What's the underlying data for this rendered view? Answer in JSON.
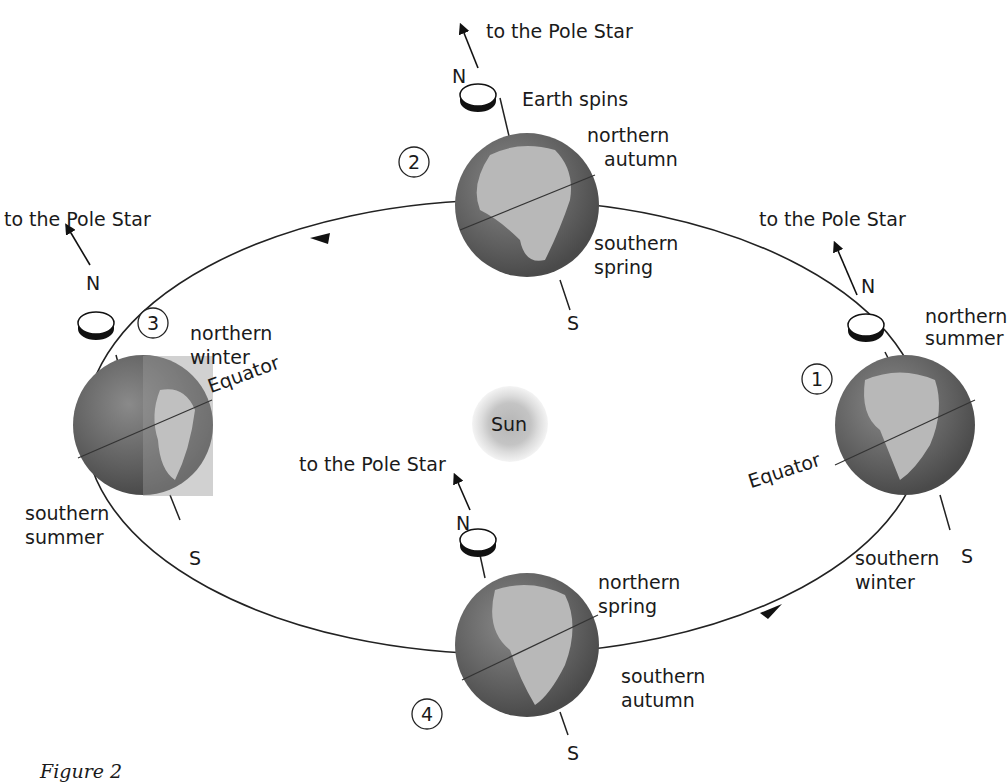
{
  "figure": {
    "caption": "Figure 2",
    "sun_label": "Sun",
    "pole_star_label": "to the Pole Star",
    "north_label": "N",
    "south_label": "S",
    "equator_label": "Equator",
    "spin_label": "Earth spins"
  },
  "positions": [
    {
      "number": "1",
      "north_season": "northern summer",
      "north_lines": [
        "northern",
        "summer"
      ],
      "south_season": "southern winter",
      "south_lines": [
        "southern",
        "winter"
      ]
    },
    {
      "number": "2",
      "north_season": "northern autumn",
      "north_lines": [
        "northern",
        "autumn"
      ],
      "south_season": "southern spring",
      "south_lines": [
        "southern",
        "spring"
      ]
    },
    {
      "number": "3",
      "north_season": "northern winter",
      "north_lines": [
        "northern",
        "winter"
      ],
      "south_season": "southern summer",
      "south_lines": [
        "southern",
        "summer"
      ]
    },
    {
      "number": "4",
      "north_season": "northern spring",
      "north_lines": [
        "northern",
        "spring"
      ],
      "south_season": "southern autumn",
      "south_lines": [
        "southern",
        "autumn"
      ]
    }
  ],
  "colors": {
    "ocean": "#6e6e6e",
    "land": "#b4b4b4",
    "sun_core": "#bdbdbd",
    "sun_halo": "#e6e6e6",
    "ink": "#1a1a1a"
  }
}
